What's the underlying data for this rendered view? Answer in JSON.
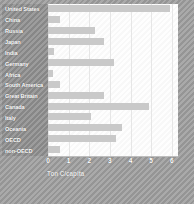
{
  "chart_data": {
    "type": "bar",
    "orientation": "horizontal",
    "title": "",
    "xlabel": "Ton C/capita",
    "ylabel": "",
    "xlim": [
      0,
      6.3
    ],
    "xticks": [
      "0",
      "1",
      "2",
      "3",
      "4",
      "5",
      "6"
    ],
    "xtick_values": [
      0,
      1,
      2,
      3,
      4,
      5,
      6
    ],
    "grid": true,
    "legend": "none",
    "categories": [
      "United States",
      "China",
      "Russia",
      "Japan",
      "India",
      "Germany",
      "Africa",
      "South America",
      "Great Britain",
      "Canada",
      "Italy",
      "Oceania",
      "OECD",
      "non-OECD"
    ],
    "values": [
      5.9,
      0.6,
      2.3,
      2.7,
      0.3,
      3.2,
      0.25,
      0.6,
      2.7,
      4.9,
      2.1,
      3.6,
      3.3,
      0.6
    ]
  },
  "colors": {
    "figure_background": "#9d9d9d",
    "plot_background": "#fdfdfd",
    "bar_fill": "#c9c9c9",
    "gridline": "#e6e6e6",
    "label_panel": "#8f8f8f",
    "label_text": "#ffffff",
    "tick_text": "#ffffff",
    "axis_label_text": "#e9e9e9"
  }
}
